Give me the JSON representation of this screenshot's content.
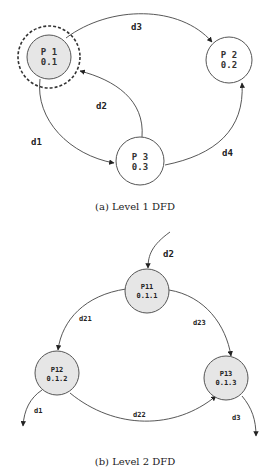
{
  "level1": {
    "caption": "(a) Level 1 DFD",
    "nodes": [
      {
        "id": "P1",
        "name": "P 1",
        "number": "0.1",
        "fill": "#e6e6e6",
        "highlighted": true
      },
      {
        "id": "P2",
        "name": "P 2",
        "number": "0.2",
        "fill": "#ffffff",
        "highlighted": false
      },
      {
        "id": "P3",
        "name": "P 3",
        "number": "0.3",
        "fill": "#ffffff",
        "highlighted": false
      }
    ],
    "flows": [
      {
        "label": "d3",
        "from": "P1",
        "to": "P2"
      },
      {
        "label": "d2",
        "from": "P3",
        "to": "P1"
      },
      {
        "label": "d1",
        "from": "P1",
        "to": "P3"
      },
      {
        "label": "d4",
        "from": "P3",
        "to": "P2"
      }
    ]
  },
  "level2": {
    "caption": "(b) Level 2 DFD",
    "nodes": [
      {
        "id": "P11",
        "name": "P11",
        "number": "0.1.1",
        "fill": "#e6e6e6"
      },
      {
        "id": "P12",
        "name": "P12",
        "number": "0.1.2",
        "fill": "#e6e6e6"
      },
      {
        "id": "P13",
        "name": "P13",
        "number": "0.1.3",
        "fill": "#e6e6e6"
      }
    ],
    "flows": [
      {
        "label": "d2",
        "from": "external",
        "to": "P11"
      },
      {
        "label": "d21",
        "from": "P11",
        "to": "P12"
      },
      {
        "label": "d23",
        "from": "P11",
        "to": "P13"
      },
      {
        "label": "d22",
        "from": "P12",
        "to": "P13"
      },
      {
        "label": "d1",
        "from": "P12",
        "to": "external"
      },
      {
        "label": "d3",
        "from": "P13",
        "to": "external"
      }
    ]
  }
}
